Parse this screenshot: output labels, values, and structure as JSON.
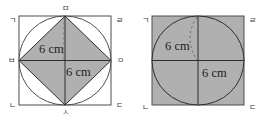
{
  "document": {
    "kind": "geometry-figure-pair",
    "description": "Two squares of equal size; left contains an inscribed circle and a shaded inner square joining the side midpoints, right contains a shaded square with an inscribed shaded circle divided by two diameters."
  },
  "palette": {
    "shaded_fill": "#b0b0b0",
    "unshaded_fill": "#ffffff",
    "stroke": "#4d4d4d",
    "heavy_stroke": "#2e2e2e",
    "dashed_stroke": "#6e6e6e",
    "label_color": "#3a3a3a",
    "dimension_color": "#1c1c1c",
    "background": "#ffffff"
  },
  "figures": [
    {
      "id": "left-figure",
      "name": "square-with-inscribed-circle-and-midpoint-square",
      "outer_shape": "square",
      "outer_fill": "unshaded",
      "circle_fill": "unshaded",
      "inner_shape": "square",
      "inner_fill": "shaded",
      "vertices": {
        "top_left": "ㄱ",
        "top_right": "ㄹ",
        "bottom_left": "ㄴ",
        "bottom_right": "ㄷ",
        "top_mid": "ㅁ",
        "left_mid": "ㅂ",
        "right_mid": "ㅇ",
        "bottom_mid": "ㅅ"
      },
      "dimensions": [
        {
          "id": "left-dim-upper",
          "text": "6 cm"
        },
        {
          "id": "left-dim-lower",
          "text": "6 cm"
        }
      ],
      "guides": [
        {
          "id": "left-dashed-radius",
          "style": "dashed",
          "orientation": "vertical"
        }
      ]
    },
    {
      "id": "right-figure",
      "name": "shaded-square-with-inscribed-circle",
      "outer_shape": "square",
      "outer_fill": "shaded",
      "circle_fill": "shaded",
      "vertices": {
        "top_left": "ㄱ",
        "top_right": "ㄹ",
        "bottom_left": "ㄴ",
        "bottom_right": "ㄷ"
      },
      "dimensions": [
        {
          "id": "right-dim-upper",
          "text": "6 cm"
        },
        {
          "id": "right-dim-lower",
          "text": "6 cm"
        }
      ],
      "guides": [
        {
          "id": "right-dashed-arc",
          "style": "dashed",
          "orientation": "arc"
        },
        {
          "id": "right-vertical-diameter",
          "style": "solid",
          "orientation": "vertical"
        },
        {
          "id": "right-horizontal-diameter",
          "style": "solid",
          "orientation": "horizontal"
        }
      ]
    }
  ]
}
